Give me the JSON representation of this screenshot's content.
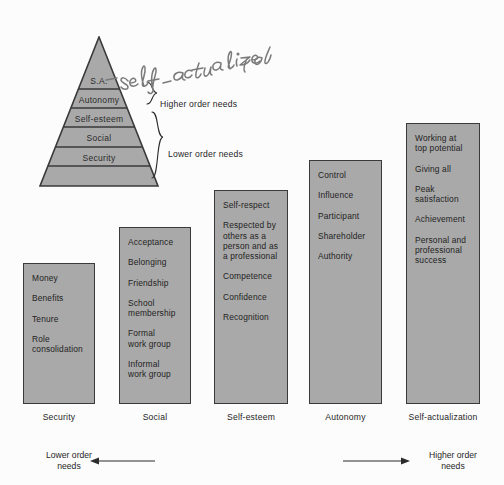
{
  "diagram": {
    "handwritten_note": "- self-actualized",
    "pyramid": {
      "tiers": [
        {
          "label": "S.A."
        },
        {
          "label": "Autonomy"
        },
        {
          "label": "Self-esteem"
        },
        {
          "label": "Social"
        },
        {
          "label": "Security"
        }
      ],
      "brackets": {
        "higher": "Higher order needs",
        "lower": "Lower order needs"
      }
    },
    "columns": [
      {
        "axis_label": "Security",
        "items": [
          "Money",
          "Benefits",
          "Tenure",
          "Role\nconsolidation"
        ]
      },
      {
        "axis_label": "Social",
        "items": [
          "Acceptance",
          "Belonging",
          "Friendship",
          "School\nmembership",
          "Formal\nwork group",
          "Informal\nwork group"
        ]
      },
      {
        "axis_label": "Self-esteem",
        "items": [
          "Self-respect",
          "Respected by\nothers as a\nperson and as\na professional",
          "Competence",
          "Confidence",
          "Recognition"
        ]
      },
      {
        "axis_label": "Autonomy",
        "items": [
          "Control",
          "Influence",
          "Participant",
          "Shareholder",
          "Authority"
        ]
      },
      {
        "axis_label": "Self-actualization",
        "items": [
          "Working at\ntop potential",
          "Giving all",
          "Peak\nsatisfaction",
          "Achievement",
          "Personal and\nprofessional\nsuccess"
        ]
      }
    ],
    "footer": {
      "left_note": "Lower order\nneeds",
      "right_note": "Higher order\nneeds"
    },
    "colors": {
      "fill": "#a9a9a9",
      "stroke": "#3a3a3a",
      "background": "#fcfcfc",
      "text": "#232323"
    }
  }
}
